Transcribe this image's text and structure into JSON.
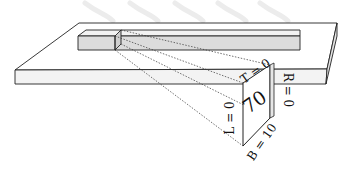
{
  "diagram": {
    "type": "3d-isometric-cross-section",
    "cross_section": {
      "center_value": "70",
      "labels": {
        "top": "T = 0",
        "right": "R = 0",
        "left": "L = 0",
        "bottom": "B = 10"
      }
    },
    "colors": {
      "stroke": "#222222",
      "plate_top": "#ffffff",
      "plate_front": "#f2f2f2",
      "bar_face": "#dcdcdc",
      "bar_top": "#f0f0f0",
      "watermark": "#e8e8e8"
    }
  }
}
